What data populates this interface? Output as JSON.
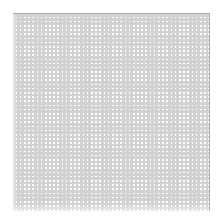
{
  "figure": {
    "title": "",
    "background_color": "#ffffff"
  },
  "chart_data": {
    "type": "heatmap",
    "title": "",
    "subtitle": "",
    "xlabel": "",
    "ylabel": "",
    "grid": true,
    "legend": null,
    "legend_position": "none",
    "rows": 47,
    "columns": 47,
    "cell_pitch_px": 4.19,
    "cell_size_px": 2.6,
    "gridline_width_px": 1.6,
    "value_uniform": 1,
    "cell_color": "#c6c6c6",
    "gridline_color": "#ffffff",
    "colors": {
      "cell_fill": "#c6c6c6",
      "gridline": "#ffffff",
      "top_border": "#a9a9a9",
      "right_border": "#b0b0b0",
      "page_background": "#ffffff"
    },
    "plot_area_px": {
      "left": 13,
      "top": 14,
      "width": 197,
      "height": 197
    },
    "xlim": [
      0,
      47
    ],
    "ylim": [
      0,
      47
    ],
    "xticks": [],
    "yticks": [],
    "xticklabels": [],
    "yticklabels": [],
    "annotations": []
  },
  "borders": {
    "top_rule_label": "top-border-rule",
    "right_rule_label": "right-border-rule"
  },
  "accessibility": {
    "alt_text": "Dense uniform light-gray grid pattern"
  }
}
